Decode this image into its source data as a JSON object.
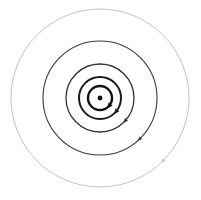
{
  "diagram": {
    "type": "concentric-orbits",
    "center": {
      "x": 100,
      "y": 98,
      "dot_radius": 2.4,
      "color": "#111111"
    },
    "rings": [
      {
        "radius": 12,
        "stroke": "#111111",
        "width": 2.4,
        "arrow_angle_deg": 40
      },
      {
        "radius": 21,
        "stroke": "#1a1a1a",
        "width": 2.0,
        "arrow_angle_deg": 40
      },
      {
        "radius": 34,
        "stroke": "#333333",
        "width": 1.3,
        "arrow_angle_deg": 42
      },
      {
        "radius": 57,
        "stroke": "#3a3a3a",
        "width": 1.1,
        "arrow_angle_deg": 46
      },
      {
        "radius": 89,
        "stroke": "#bdbdbd",
        "width": 0.9,
        "arrow_angle_deg": 45
      }
    ],
    "arrow_direction": "clockwise",
    "background": "#ffffff"
  }
}
